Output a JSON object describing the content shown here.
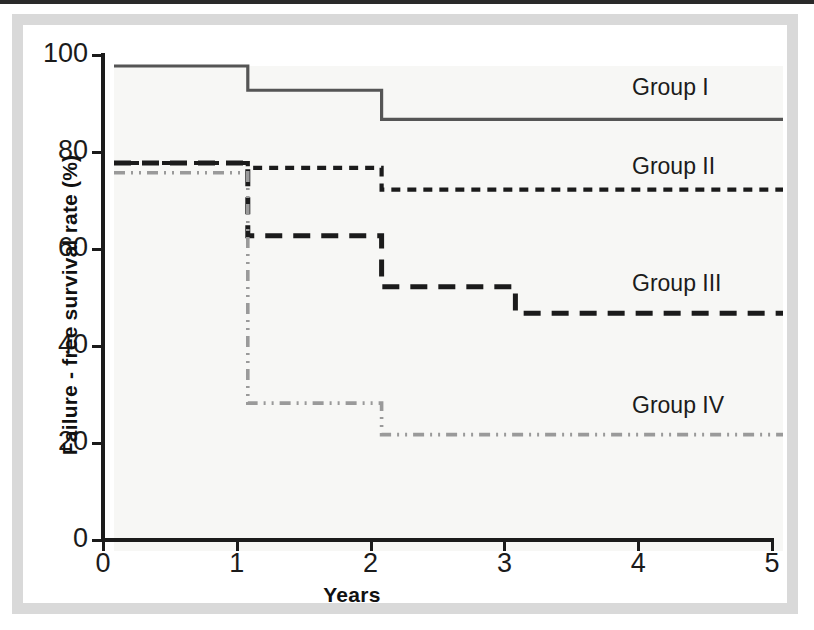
{
  "figure": {
    "frame_color": "#d9d9d9",
    "plot_background": "#f7f7f5",
    "axis_color": "#1b1b1b"
  },
  "axes": {
    "x_title": "Years",
    "y_title": "Failure - free survival rate (%)",
    "x_ticks": [
      "0",
      "1",
      "2",
      "3",
      "4",
      "5"
    ],
    "y_ticks": [
      "0",
      "20",
      "40",
      "60",
      "80",
      "100"
    ]
  },
  "series_labels": {
    "group1": "Group I",
    "group2": "Group II",
    "group3": "Group III",
    "group4": "Group IV"
  },
  "chart_data": {
    "type": "line",
    "title": "",
    "subtitle": "",
    "xlabel": "Years",
    "ylabel": "Failure - free survival rate (%)",
    "xlim": [
      0,
      5
    ],
    "ylim": [
      0,
      100
    ],
    "grid": false,
    "legend_position": "inline-right",
    "step_style": "post",
    "annotations": [
      {
        "text": "Group I",
        "x": 4.3,
        "y": 92
      },
      {
        "text": "Group II",
        "x": 4.3,
        "y": 77
      },
      {
        "text": "Group III",
        "x": 4.25,
        "y": 53
      },
      {
        "text": "Group IV",
        "x": 4.25,
        "y": 29
      }
    ],
    "series": [
      {
        "name": "Group I",
        "line_style": "solid",
        "color": "#555555",
        "x": [
          0,
          1,
          1,
          2,
          2,
          5
        ],
        "y": [
          100,
          100,
          95,
          95,
          89,
          89
        ],
        "steps": [
          {
            "from_year": 0,
            "to_year": 1,
            "value": 100
          },
          {
            "from_year": 1,
            "to_year": 2,
            "value": 95
          },
          {
            "from_year": 2,
            "to_year": 5,
            "value": 89
          }
        ]
      },
      {
        "name": "Group II",
        "line_style": "dotted",
        "color": "#1b1b1b",
        "x": [
          0,
          1,
          1,
          2,
          2,
          5
        ],
        "y": [
          80,
          80,
          79,
          79,
          74.5,
          74.5
        ],
        "steps": [
          {
            "from_year": 0,
            "to_year": 1,
            "value": 80
          },
          {
            "from_year": 1,
            "to_year": 2,
            "value": 79
          },
          {
            "from_year": 2,
            "to_year": 5,
            "value": 74.5
          }
        ]
      },
      {
        "name": "Group III",
        "line_style": "dashed",
        "color": "#1b1b1b",
        "x": [
          0,
          1,
          1,
          2,
          2,
          3,
          3,
          5
        ],
        "y": [
          80,
          80,
          65,
          65,
          54.5,
          54.5,
          49,
          49
        ],
        "steps": [
          {
            "from_year": 0,
            "to_year": 1,
            "value": 80
          },
          {
            "from_year": 1,
            "to_year": 2,
            "value": 65
          },
          {
            "from_year": 2,
            "to_year": 3,
            "value": 54.5
          },
          {
            "from_year": 3,
            "to_year": 5,
            "value": 49
          }
        ]
      },
      {
        "name": "Group IV",
        "line_style": "dash-dot-dot",
        "color": "#9a9a9a",
        "x": [
          0,
          1,
          1,
          2,
          2,
          5
        ],
        "y": [
          78,
          78,
          30.5,
          30.5,
          24,
          24
        ],
        "steps": [
          {
            "from_year": 0,
            "to_year": 1,
            "value": 78
          },
          {
            "from_year": 1,
            "to_year": 2,
            "value": 30.5
          },
          {
            "from_year": 2,
            "to_year": 5,
            "value": 24
          }
        ]
      }
    ]
  }
}
